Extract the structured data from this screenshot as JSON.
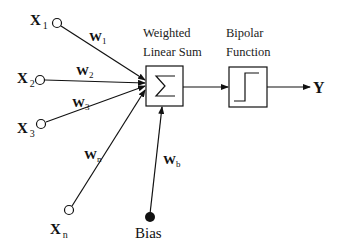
{
  "diagram": {
    "inputs": [
      {
        "label": "X",
        "sub": "1",
        "weight": "W",
        "weight_sub": "1"
      },
      {
        "label": "X",
        "sub": "2",
        "weight": "W",
        "weight_sub": "2"
      },
      {
        "label": "X",
        "sub": "3",
        "weight": "W",
        "weight_sub": "3"
      },
      {
        "label": "X",
        "sub": "n",
        "weight": "W",
        "weight_sub": "n"
      }
    ],
    "sum_block": {
      "title_line1": "Weighted",
      "title_line2": "Linear Sum",
      "symbol": "Σ"
    },
    "activation_block": {
      "title_line1": "Bipolar",
      "title_line2": "Function",
      "icon": "step-function-icon"
    },
    "output": {
      "label": "Y"
    },
    "bias": {
      "label": "Bias",
      "weight": "W",
      "weight_sub": "b"
    },
    "colors": {
      "stroke": "#111111",
      "background": "#ffffff"
    }
  }
}
